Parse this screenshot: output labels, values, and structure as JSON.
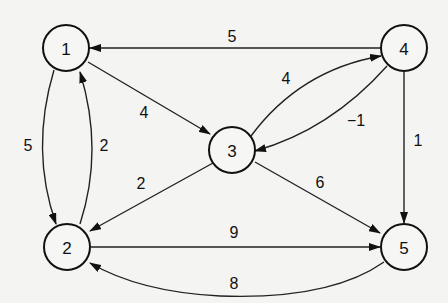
{
  "diagram": {
    "type": "weighted-directed-graph",
    "nodes": [
      {
        "id": "1",
        "label": "1",
        "x": 66,
        "y": 48
      },
      {
        "id": "2",
        "label": "2",
        "x": 67,
        "y": 247
      },
      {
        "id": "3",
        "label": "3",
        "x": 232,
        "y": 150
      },
      {
        "id": "4",
        "label": "4",
        "x": 404,
        "y": 48
      },
      {
        "id": "5",
        "label": "5",
        "x": 404,
        "y": 247
      }
    ],
    "edges": [
      {
        "from": "4",
        "to": "1",
        "weight": "5"
      },
      {
        "from": "1",
        "to": "3",
        "weight": "4"
      },
      {
        "from": "1",
        "to": "2",
        "weight": "5"
      },
      {
        "from": "2",
        "to": "1",
        "weight": "2"
      },
      {
        "from": "3",
        "to": "4",
        "weight": "4"
      },
      {
        "from": "4",
        "to": "3",
        "weight": "−1"
      },
      {
        "from": "3",
        "to": "2",
        "weight": "2"
      },
      {
        "from": "3",
        "to": "5",
        "weight": "6"
      },
      {
        "from": "4",
        "to": "5",
        "weight": "1"
      },
      {
        "from": "2",
        "to": "5",
        "weight": "9"
      },
      {
        "from": "5",
        "to": "2",
        "weight": "8"
      }
    ]
  }
}
